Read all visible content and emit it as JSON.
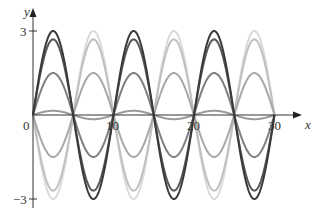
{
  "chart_data": {
    "type": "line",
    "title": "",
    "xlabel": "x",
    "ylabel": "y",
    "xlim": [
      0,
      30
    ],
    "ylim": [
      -3,
      3
    ],
    "x_ticks": [
      0,
      10,
      20,
      30
    ],
    "x_tick_labels": [
      "0",
      "10",
      "20",
      "30"
    ],
    "y_ticks": [
      3,
      -3
    ],
    "y_tick_labels": [
      "3",
      "−3"
    ],
    "grid": false,
    "legend": null,
    "function_form": "y = A sin(πx/5)",
    "series": [
      {
        "name": "A = 3",
        "amplitude": 3,
        "color": "#3a3a3a"
      },
      {
        "name": "A = 2.7",
        "amplitude": 2.7,
        "color": "#555555"
      },
      {
        "name": "A = 1.5",
        "amplitude": 1.5,
        "color": "#7f7f7f"
      },
      {
        "name": "A = 0.15",
        "amplitude": 0.15,
        "color": "#9a9a9a"
      },
      {
        "name": "A = -1.5",
        "amplitude": -1.5,
        "color": "#a8a8a8"
      },
      {
        "name": "A = -2.7",
        "amplitude": -2.7,
        "color": "#c0c0c0"
      },
      {
        "name": "A = -3",
        "amplitude": -3,
        "color": "#dadada"
      }
    ],
    "sample_points": {
      "x": [
        0,
        2.5,
        5,
        7.5,
        10,
        12.5,
        15,
        17.5,
        20,
        22.5,
        25,
        27.5,
        30
      ],
      "A=3": [
        0,
        3,
        0,
        -3,
        0,
        3,
        0,
        -3,
        0,
        3,
        0,
        -3,
        0
      ]
    }
  },
  "axes": {
    "x_label": "x",
    "y_label": "y",
    "origin_label": "0",
    "x_tick_labels": [
      "10",
      "20",
      "30"
    ],
    "y_top_label": "3",
    "y_bottom_label": "−3"
  },
  "colors": {
    "axis": "#333333",
    "background": "#ffffff"
  }
}
